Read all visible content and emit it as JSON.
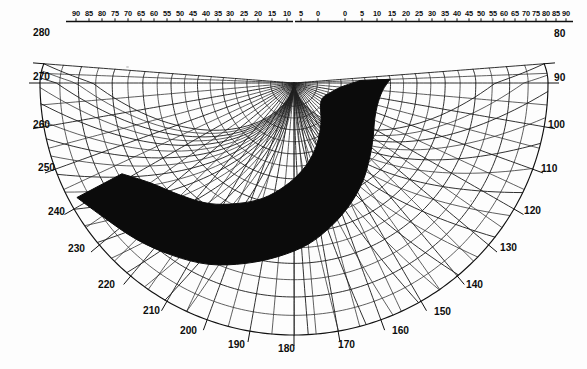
{
  "figure": {
    "name": "solar-path-shading-chart",
    "center_x": 294,
    "center_y": 83,
    "background_color": "#fdfdfd",
    "ink_color": "#0d0d0d",
    "mask_color": "#0b0b0b"
  },
  "chart_data": {
    "type": "line",
    "title": "",
    "subtitle": "",
    "xlabel": "",
    "ylabel": "",
    "projection": "stereographic-polar",
    "grid": true,
    "legend": null,
    "top_scale_left": [
      "90",
      "85",
      "80",
      "75",
      "70",
      "65",
      "60",
      "55",
      "50",
      "45",
      "40",
      "35",
      "30",
      "25",
      "20",
      "15",
      "10",
      "5",
      "0"
    ],
    "top_scale_right": [
      "0",
      "5",
      "10",
      "15",
      "20",
      "25",
      "30",
      "35",
      "40",
      "45",
      "50",
      "55",
      "60",
      "65",
      "70",
      "75",
      "80",
      "85",
      "90"
    ],
    "perimeter_labels_left": [
      "280",
      "270",
      "260",
      "250",
      "240",
      "230",
      "220",
      "210",
      "200"
    ],
    "perimeter_labels_bottom": [
      "190",
      "180",
      "170"
    ],
    "perimeter_labels_right": [
      "160",
      "150",
      "140",
      "130",
      "120",
      "110",
      "100",
      "90",
      "80"
    ],
    "azimuth_range": [
      80,
      280
    ],
    "azimuth_step": 10,
    "elevation_range": [
      0,
      90
    ],
    "elevation_step": 5,
    "series": [
      {
        "name": "shading-mask-outline",
        "description": "Dark crescent obstruction mask sweeping from upper-left through bottom to upper-right",
        "points_azimuth": [
          275,
          265,
          255,
          245,
          235,
          225,
          215,
          205,
          195,
          185,
          175,
          165,
          155,
          145,
          135,
          125,
          118
        ],
        "points_altitude_outer": [
          62,
          70,
          74,
          76,
          76,
          74,
          70,
          65,
          59,
          53,
          47,
          41,
          36,
          31,
          27,
          22,
          16
        ],
        "points_altitude_inner": [
          50,
          53,
          54,
          53,
          50,
          46,
          41,
          36,
          31,
          26,
          22,
          18,
          14,
          11,
          8,
          5,
          2
        ]
      }
    ]
  },
  "top_scale": {
    "name": "altitude-scale",
    "left_ticks": [
      {
        "label": "90",
        "x": 76
      },
      {
        "label": "85",
        "x": 89
      },
      {
        "label": "80",
        "x": 102
      },
      {
        "label": "75",
        "x": 115
      },
      {
        "label": "70",
        "x": 128
      },
      {
        "label": "65",
        "x": 141
      },
      {
        "label": "60",
        "x": 154
      },
      {
        "label": "55",
        "x": 167
      },
      {
        "label": "50",
        "x": 180
      },
      {
        "label": "45",
        "x": 193
      },
      {
        "label": "40",
        "x": 206
      },
      {
        "label": "35",
        "x": 218
      },
      {
        "label": "30",
        "x": 230
      },
      {
        "label": "25",
        "x": 244
      },
      {
        "label": "20",
        "x": 258
      },
      {
        "label": "15",
        "x": 272
      },
      {
        "label": "10",
        "x": 287
      },
      {
        "label": "5",
        "x": 301
      },
      {
        "label": "0",
        "x": 318
      }
    ],
    "right_ticks": [
      {
        "label": "0",
        "x": 345
      },
      {
        "label": "5",
        "x": 362
      },
      {
        "label": "10",
        "x": 377
      },
      {
        "label": "15",
        "x": 392
      },
      {
        "label": "20",
        "x": 406
      },
      {
        "label": "25",
        "x": 419
      },
      {
        "label": "30",
        "x": 432
      },
      {
        "label": "35",
        "x": 445
      },
      {
        "label": "40",
        "x": 457
      },
      {
        "label": "45",
        "x": 469
      },
      {
        "label": "50",
        "x": 481
      },
      {
        "label": "55",
        "x": 493
      },
      {
        "label": "60",
        "x": 504
      },
      {
        "label": "65",
        "x": 515
      },
      {
        "label": "70",
        "x": 526
      },
      {
        "label": "75",
        "x": 536
      },
      {
        "label": "80",
        "x": 546
      },
      {
        "label": "85",
        "x": 556
      },
      {
        "label": "90",
        "x": 566
      }
    ]
  },
  "perimeter": {
    "name": "azimuth-scale",
    "labels": [
      {
        "label": "280",
        "x": 33,
        "y": 36,
        "anchor": "start"
      },
      {
        "label": "270",
        "x": 33,
        "y": 80,
        "anchor": "start"
      },
      {
        "label": "260",
        "x": 33,
        "y": 128,
        "anchor": "start"
      },
      {
        "label": "250",
        "x": 38,
        "y": 171,
        "anchor": "start"
      },
      {
        "label": "240",
        "x": 48,
        "y": 215,
        "anchor": "start"
      },
      {
        "label": "230",
        "x": 68,
        "y": 252,
        "anchor": "start"
      },
      {
        "label": "220",
        "x": 98,
        "y": 288,
        "anchor": "start"
      },
      {
        "label": "210",
        "x": 143,
        "y": 314,
        "anchor": "start"
      },
      {
        "label": "200",
        "x": 180,
        "y": 334,
        "anchor": "start"
      },
      {
        "label": "190",
        "x": 228,
        "y": 348,
        "anchor": "start"
      },
      {
        "label": "180",
        "x": 278,
        "y": 352,
        "anchor": "start"
      },
      {
        "label": "170",
        "x": 338,
        "y": 348,
        "anchor": "start"
      },
      {
        "label": "160",
        "x": 392,
        "y": 334,
        "anchor": "start"
      },
      {
        "label": "150",
        "x": 434,
        "y": 315,
        "anchor": "start"
      },
      {
        "label": "140",
        "x": 466,
        "y": 288,
        "anchor": "start"
      },
      {
        "label": "130",
        "x": 500,
        "y": 251,
        "anchor": "start"
      },
      {
        "label": "120",
        "x": 524,
        "y": 214,
        "anchor": "start"
      },
      {
        "label": "110",
        "x": 541,
        "y": 172,
        "anchor": "start"
      },
      {
        "label": "100",
        "x": 548,
        "y": 128,
        "anchor": "start"
      },
      {
        "label": "90",
        "x": 554,
        "y": 81,
        "anchor": "start"
      },
      {
        "label": "80",
        "x": 554,
        "y": 37,
        "anchor": "start"
      }
    ]
  }
}
